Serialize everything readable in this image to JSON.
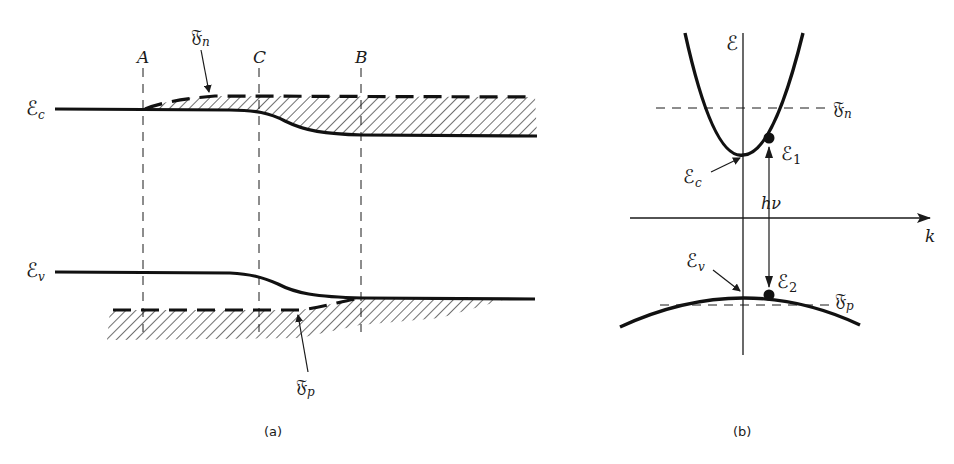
{
  "figure": {
    "panel_a": {
      "caption": "(a)",
      "positions": [
        "A",
        "C",
        "B"
      ],
      "labels": {
        "conduction_band": "ℰ",
        "conduction_band_sub": "c",
        "valence_band": "ℰ",
        "valence_band_sub": "v",
        "electron_quasi_fermi": "𝔉",
        "electron_quasi_fermi_sub": "n",
        "hole_quasi_fermi": "𝔉",
        "hole_quasi_fermi_sub": "p"
      }
    },
    "panel_b": {
      "caption": "(b)",
      "labels": {
        "energy_axis": "ℰ",
        "k_axis": "k",
        "electron_quasi_fermi": "𝔉",
        "electron_quasi_fermi_sub": "n",
        "hole_quasi_fermi": "𝔉",
        "hole_quasi_fermi_sub": "p",
        "conduction_edge": "ℰ",
        "conduction_edge_sub": "c",
        "valence_edge": "ℰ",
        "valence_edge_sub": "v",
        "upper_state": "ℰ",
        "upper_state_sub": "1",
        "lower_state": "ℰ",
        "lower_state_sub": "2",
        "photon": "hν"
      }
    },
    "colors": {
      "ink": "#1a1a1a",
      "background": "#ffffff"
    }
  }
}
